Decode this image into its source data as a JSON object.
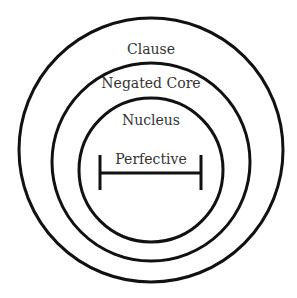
{
  "diagram": {
    "type": "nested-circles",
    "stroke_color": "#111111",
    "text_color": "#333333",
    "layers": [
      {
        "label": "Clause",
        "cx": 151,
        "cy": 150,
        "r": 132,
        "label_y": 54
      },
      {
        "label": "Negated Core",
        "cx": 151,
        "cy": 162,
        "r": 99,
        "label_y": 88
      },
      {
        "label": "Nucleus",
        "cx": 151,
        "cy": 170,
        "r": 72,
        "label_y": 125
      }
    ],
    "center_element": {
      "label": "Perfective",
      "shape": "interval-bar",
      "x1": 100,
      "x2": 201,
      "y": 173,
      "cap_top": 155,
      "cap_bottom": 190,
      "label_y": 164
    }
  }
}
